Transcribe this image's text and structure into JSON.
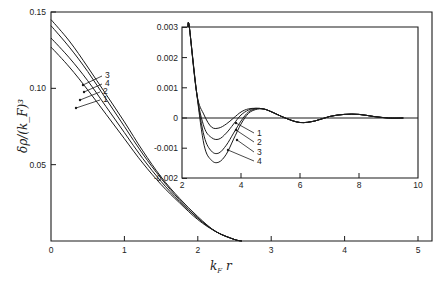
{
  "chart_data": [
    {
      "id": "main",
      "type": "line",
      "title": "",
      "xlabel": "k_F r",
      "ylabel": "δρ/(k_F)^3",
      "xlim": [
        0,
        5.2
      ],
      "ylim": [
        0,
        0.15
      ],
      "xticks": [
        0,
        1,
        2,
        3,
        4,
        5
      ],
      "xtick_labels": [
        "0",
        "1",
        "2",
        "3",
        "4",
        "5"
      ],
      "yticks": [
        0.05,
        0.1,
        0.15
      ],
      "ytick_labels": [
        "0.05",
        "0.10",
        "0.15"
      ],
      "grid": false,
      "legend": "inline callouts (3, 4, 2, 1 from top)",
      "series": [
        {
          "name": "1",
          "x": [
            0,
            0.25,
            0.5,
            0.75,
            1.0,
            1.25,
            1.5,
            1.75,
            2.0,
            2.25,
            2.5,
            2.6
          ],
          "y": [
            0.127,
            0.114,
            0.099,
            0.083,
            0.067,
            0.051,
            0.037,
            0.025,
            0.014,
            0.006,
            0.001,
            0.0
          ]
        },
        {
          "name": "2",
          "x": [
            0,
            0.25,
            0.5,
            0.75,
            1.0,
            1.25,
            1.5,
            1.75,
            2.0,
            2.25,
            2.5,
            2.6
          ],
          "y": [
            0.133,
            0.12,
            0.105,
            0.088,
            0.071,
            0.054,
            0.039,
            0.026,
            0.015,
            0.006,
            0.001,
            0.0
          ]
        },
        {
          "name": "4",
          "x": [
            0,
            0.25,
            0.5,
            0.75,
            1.0,
            1.25,
            1.5,
            1.75,
            2.0,
            2.25,
            2.5,
            2.6
          ],
          "y": [
            0.141,
            0.127,
            0.111,
            0.093,
            0.075,
            0.057,
            0.041,
            0.027,
            0.015,
            0.006,
            0.001,
            0.0
          ]
        },
        {
          "name": "3",
          "x": [
            0,
            0.25,
            0.5,
            0.75,
            1.0,
            1.25,
            1.5,
            1.75,
            2.0,
            2.25,
            2.5,
            2.6
          ],
          "y": [
            0.145,
            0.131,
            0.114,
            0.096,
            0.078,
            0.059,
            0.042,
            0.028,
            0.016,
            0.006,
            0.001,
            0.0
          ]
        }
      ]
    },
    {
      "id": "inset",
      "type": "line",
      "title": "",
      "xlabel": "",
      "ylabel": "",
      "xlim": [
        2,
        10
      ],
      "ylim": [
        -0.002,
        0.003
      ],
      "xticks": [
        2,
        4,
        6,
        8,
        10
      ],
      "xtick_labels": [
        "2",
        "4",
        "6",
        "8",
        "10"
      ],
      "yticks": [
        0.003,
        0.002,
        0.001,
        0,
        -0.001,
        -0.002
      ],
      "ytick_labels": [
        "0.003",
        "0.002",
        "0.001",
        "0",
        "-0.001",
        "-0.002"
      ],
      "grid": false,
      "zero_line": true,
      "legend": "inline callouts (1, 2, 3, 4 from top)",
      "series": [
        {
          "name": "1",
          "x": [
            2.25,
            2.5,
            2.75,
            3.0,
            3.25,
            3.5,
            3.75,
            4.0,
            4.25,
            4.5,
            4.75,
            5.0,
            5.5,
            6.0,
            6.5,
            7.0,
            7.5,
            8.0,
            8.5,
            9.0,
            9.5
          ],
          "y": [
            0.003,
            0.0008,
            0.0001,
            -0.0003,
            -0.00033,
            -0.0002,
            0.0,
            0.0002,
            0.0003,
            0.00032,
            0.0003,
            0.00022,
            0.0,
            -0.00015,
            -0.0001,
            5e-05,
            0.00012,
            0.00012,
            5e-05,
            0.0,
            0.0
          ]
        },
        {
          "name": "2",
          "x": [
            2.25,
            2.5,
            2.75,
            3.0,
            3.25,
            3.5,
            3.75,
            4.0,
            4.25,
            4.5,
            4.75,
            5.0,
            5.5,
            6.0,
            6.5,
            7.0,
            7.5,
            8.0,
            8.5,
            9.0,
            9.5
          ],
          "y": [
            0.003,
            0.0008,
            -0.0003,
            -0.00065,
            -0.0007,
            -0.0005,
            -0.0002,
            0.0001,
            0.00026,
            0.00032,
            0.0003,
            0.00022,
            0.0,
            -0.00015,
            -0.0001,
            5e-05,
            0.00012,
            0.00012,
            5e-05,
            0.0,
            0.0
          ]
        },
        {
          "name": "3",
          "x": [
            2.25,
            2.5,
            2.75,
            3.0,
            3.25,
            3.5,
            3.75,
            4.0,
            4.25,
            4.5,
            4.75,
            5.0,
            5.5,
            6.0,
            6.5,
            7.0,
            7.5,
            8.0,
            8.5,
            9.0,
            9.5
          ],
          "y": [
            0.003,
            0.0008,
            -0.0006,
            -0.0011,
            -0.00116,
            -0.0009,
            -0.0005,
            -0.0001,
            0.0002,
            0.0003,
            0.0003,
            0.00022,
            0.0,
            -0.00015,
            -0.0001,
            5e-05,
            0.00012,
            0.00012,
            5e-05,
            0.0,
            0.0
          ]
        },
        {
          "name": "4",
          "x": [
            2.25,
            2.5,
            2.75,
            3.0,
            3.25,
            3.5,
            3.75,
            4.0,
            4.25,
            4.5,
            4.75,
            5.0,
            5.5,
            6.0,
            6.5,
            7.0,
            7.5,
            8.0,
            8.5,
            9.0,
            9.5
          ],
          "y": [
            0.003,
            0.0008,
            -0.0009,
            -0.0014,
            -0.00146,
            -0.0012,
            -0.0007,
            -0.0002,
            0.00015,
            0.00028,
            0.0003,
            0.00022,
            0.0,
            -0.00015,
            -0.0001,
            5e-05,
            0.00012,
            0.00012,
            5e-05,
            0.0,
            0.0
          ]
        }
      ]
    }
  ],
  "labels": {
    "main_ylabel": "δρ/(k_F)³",
    "main_xlabel_k": "k",
    "main_xlabel_sub": "F",
    "main_xlabel_r": " r",
    "main_callouts": [
      "3",
      "4",
      "2",
      "1"
    ],
    "inset_callouts": [
      "1",
      "2",
      "3",
      "4"
    ]
  },
  "colors": {
    "ink": "#1a1a1a",
    "background": "#ffffff"
  }
}
